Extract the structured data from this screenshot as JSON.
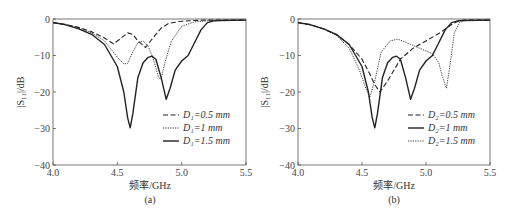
{
  "chart_data": [
    {
      "type": "line",
      "panel_label": "(a)",
      "xlabel": "频率/GHz",
      "ylabel": "|S11|/dB",
      "xlim": [
        4.0,
        5.5
      ],
      "ylim": [
        -40,
        0
      ],
      "xticks": [
        "4.0",
        "4.5",
        "5.0",
        "5.5"
      ],
      "yticks": [
        "0",
        "−10",
        "−20",
        "−30",
        "−40"
      ],
      "grid": false,
      "legend_position": "lower right",
      "series": [
        {
          "name": "D1=0.5 mm",
          "style": "dashed",
          "x": [
            4.0,
            4.1,
            4.2,
            4.3,
            4.4,
            4.47,
            4.52,
            4.58,
            4.62,
            4.66,
            4.72,
            4.78,
            4.84,
            4.9,
            5.0,
            5.1,
            5.2,
            5.3,
            5.5
          ],
          "y": [
            -1,
            -1.5,
            -2.3,
            -3.5,
            -5.2,
            -6.8,
            -5.5,
            -3.8,
            -4.2,
            -6,
            -7.8,
            -5,
            -2.5,
            -1.2,
            -0.6,
            -0.4,
            -0.3,
            -0.3,
            -0.3
          ]
        },
        {
          "name": "D1=1 mm",
          "style": "dotted",
          "x": [
            4.0,
            4.1,
            4.2,
            4.3,
            4.4,
            4.5,
            4.55,
            4.58,
            4.62,
            4.66,
            4.7,
            4.74,
            4.78,
            4.82,
            4.84,
            4.87,
            4.92,
            5.0,
            5.1,
            5.2,
            5.3,
            5.5
          ],
          "y": [
            -1,
            -1.5,
            -2.5,
            -3.8,
            -6,
            -10.5,
            -12.3,
            -12.2,
            -9,
            -6.5,
            -6,
            -7.5,
            -11,
            -16,
            -16.5,
            -12,
            -6,
            -2,
            -0.8,
            -0.5,
            -0.4,
            -0.3
          ]
        },
        {
          "name": "D1=1.5 mm",
          "style": "solid",
          "x": [
            4.0,
            4.1,
            4.2,
            4.3,
            4.4,
            4.5,
            4.55,
            4.58,
            4.6,
            4.62,
            4.66,
            4.7,
            4.74,
            4.77,
            4.8,
            4.84,
            4.88,
            4.91,
            4.95,
            5.0,
            5.05,
            5.1,
            5.15,
            5.2,
            5.25,
            5.3,
            5.5
          ],
          "y": [
            -1,
            -1.6,
            -2.7,
            -4.2,
            -7,
            -13,
            -20,
            -27,
            -29.8,
            -26,
            -16,
            -12,
            -10.5,
            -10.2,
            -11,
            -16,
            -22,
            -19,
            -14,
            -11.5,
            -10,
            -6.5,
            -3,
            -1,
            -0.5,
            -0.4,
            -0.3
          ]
        }
      ]
    },
    {
      "type": "line",
      "panel_label": "(b)",
      "xlabel": "频率/GHz",
      "ylabel": "|S11|/dB",
      "xlim": [
        4.0,
        5.5
      ],
      "ylim": [
        -40,
        0
      ],
      "xticks": [
        "4.0",
        "4.5",
        "5.0",
        "5.5"
      ],
      "yticks": [
        "0",
        "−10",
        "−20",
        "−30",
        "−40"
      ],
      "grid": false,
      "legend_position": "lower right",
      "series": [
        {
          "name": "D2=0.5 mm",
          "style": "dashed",
          "x": [
            4.0,
            4.1,
            4.2,
            4.3,
            4.4,
            4.5,
            4.56,
            4.6,
            4.64,
            4.7,
            4.8,
            4.9,
            5.0,
            5.1,
            5.2,
            5.25,
            5.3,
            5.5
          ],
          "y": [
            -1,
            -1.6,
            -2.7,
            -4.3,
            -7,
            -11,
            -15,
            -18,
            -20,
            -17,
            -11,
            -8,
            -6,
            -4,
            -1.5,
            -0.6,
            -0.3,
            -0.3
          ]
        },
        {
          "name": "D2=1 mm",
          "style": "solid",
          "x": [
            4.0,
            4.1,
            4.2,
            4.3,
            4.4,
            4.5,
            4.55,
            4.58,
            4.6,
            4.62,
            4.66,
            4.7,
            4.74,
            4.77,
            4.8,
            4.84,
            4.88,
            4.91,
            4.95,
            5.0,
            5.05,
            5.1,
            5.15,
            5.2,
            5.25,
            5.3,
            5.5
          ],
          "y": [
            -1,
            -1.6,
            -2.7,
            -4.2,
            -7,
            -13,
            -20,
            -27,
            -29.8,
            -26,
            -16,
            -12,
            -10.5,
            -10.2,
            -11,
            -16,
            -22,
            -19,
            -14,
            -11.5,
            -10,
            -6.5,
            -3,
            -1,
            -0.5,
            -0.4,
            -0.3
          ]
        },
        {
          "name": "D2=1.5 mm",
          "style": "dotted",
          "x": [
            4.0,
            4.1,
            4.2,
            4.3,
            4.4,
            4.48,
            4.53,
            4.56,
            4.6,
            4.65,
            4.72,
            4.78,
            4.85,
            4.95,
            5.05,
            5.1,
            5.13,
            5.16,
            5.19,
            5.22,
            5.26,
            5.3,
            5.5
          ],
          "y": [
            -1,
            -1.6,
            -2.7,
            -4.5,
            -8,
            -14,
            -19,
            -21.5,
            -17,
            -9,
            -6,
            -5.5,
            -6.5,
            -8,
            -9.5,
            -12,
            -16,
            -19,
            -12,
            -4,
            -1,
            -0.4,
            -0.3
          ]
        }
      ]
    }
  ],
  "panels": [
    {
      "label": "(a)",
      "xlabel": "频率/GHz",
      "ylabel": "|S₁₁|/dB",
      "legend": [
        "D₁=0.5 mm",
        "D₁=1 mm",
        "D₁=1.5 mm"
      ]
    },
    {
      "label": "(b)",
      "xlabel": "频率/GHz",
      "ylabel": "|S₁₁|/dB",
      "legend": [
        "D₂=0.5 mm",
        "D₂=1 mm",
        "D₂=1.5 mm"
      ]
    }
  ]
}
